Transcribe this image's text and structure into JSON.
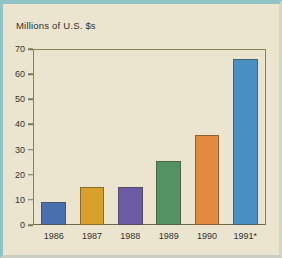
{
  "chart_data": {
    "type": "bar",
    "title": "Millions of U.S. $s",
    "xlabel": "",
    "ylabel": "",
    "categories": [
      "1986",
      "1987",
      "1988",
      "1989",
      "1990",
      "1991*"
    ],
    "values": [
      9,
      15,
      15,
      25.5,
      36,
      66
    ],
    "ylim": [
      0,
      70
    ],
    "yticks": [
      0,
      10,
      20,
      30,
      40,
      50,
      60,
      70
    ],
    "ytick_labels": [
      "0",
      "10",
      "20",
      "30",
      "40",
      "50",
      "60",
      "70"
    ],
    "grid": false,
    "legend": false,
    "bar_colors": [
      "#4a6fae",
      "#d9a12c",
      "#6a5ba4",
      "#549264",
      "#e28a3f",
      "#4a8fc4"
    ],
    "colors": {
      "background": "#ebe5d0",
      "outer_border": "#8fc3c6",
      "axis": "#7d7752",
      "text": "#33312c"
    },
    "footnote_marker": "*"
  }
}
